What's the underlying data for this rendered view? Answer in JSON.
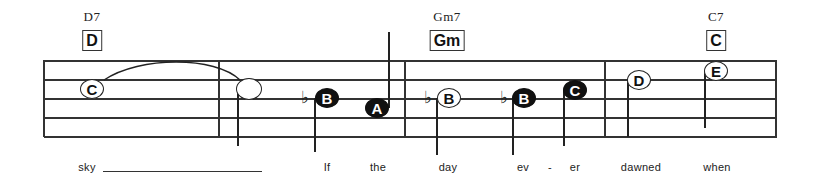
{
  "score": {
    "staff": {
      "left": 44,
      "right": 777,
      "lines_y": [
        60,
        79,
        98,
        117,
        136
      ],
      "line_color": "#333333"
    },
    "barlines_x": [
      44,
      219,
      405,
      605,
      776
    ],
    "chords": [
      {
        "name": "D7",
        "box": "D",
        "x": 92
      },
      {
        "name": "Gm7",
        "box": "Gm",
        "x": 447
      },
      {
        "name": "C7",
        "box": "C",
        "x": 716
      }
    ],
    "notes": [
      {
        "label": "C",
        "style": "open",
        "x": 92,
        "y": 89,
        "accidental": "",
        "stem": "none"
      },
      {
        "label": "",
        "style": "blank",
        "x": 249,
        "y": 89,
        "accidental": "",
        "stem": "down"
      },
      {
        "label": "B",
        "style": "filled",
        "x": 327,
        "y": 98,
        "accidental": "♭",
        "stem": "down"
      },
      {
        "label": "A",
        "style": "filled",
        "x": 377,
        "y": 108,
        "accidental": "",
        "stem": "up"
      },
      {
        "label": "B",
        "style": "open",
        "x": 449,
        "y": 98,
        "accidental": "♭",
        "stem": "down"
      },
      {
        "label": "B",
        "style": "filled",
        "x": 524,
        "y": 98,
        "accidental": "♭",
        "stem": "down"
      },
      {
        "label": "C",
        "style": "filled",
        "x": 575,
        "y": 90,
        "accidental": "",
        "stem": "down"
      },
      {
        "label": "D",
        "style": "open",
        "x": 639,
        "y": 80,
        "accidental": "",
        "stem": "down"
      },
      {
        "label": "E",
        "style": "open",
        "x": 716,
        "y": 71,
        "accidental": "",
        "stem": "down"
      }
    ],
    "tie": {
      "from_note": 0,
      "to_note": 1
    },
    "lyrics": [
      {
        "text": "sky",
        "x": 87
      },
      {
        "text": "If",
        "x": 327
      },
      {
        "text": "the",
        "x": 378
      },
      {
        "text": "day",
        "x": 448
      },
      {
        "text": "ev",
        "x": 523
      },
      {
        "text": "-",
        "x": 550
      },
      {
        "text": "er",
        "x": 575
      },
      {
        "text": "dawned",
        "x": 641
      },
      {
        "text": "when",
        "x": 717
      }
    ],
    "lyric_extender": {
      "from_x": 103,
      "to_x": 262
    }
  }
}
